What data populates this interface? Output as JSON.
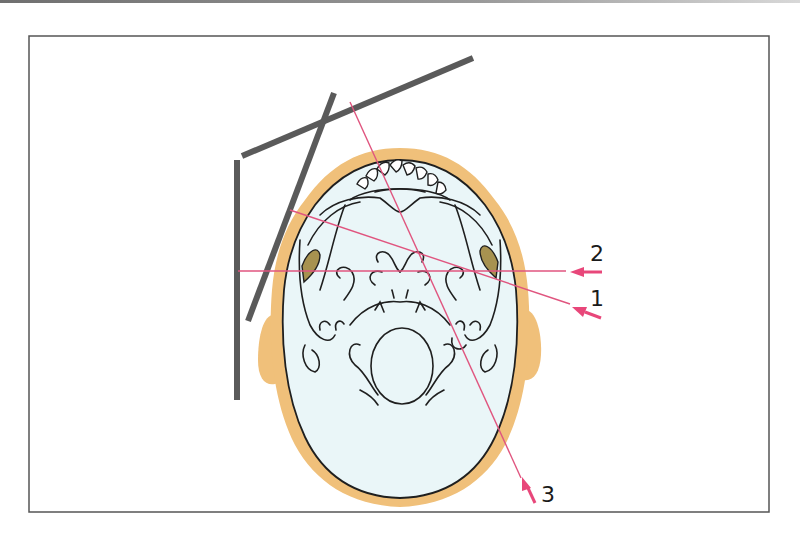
{
  "figure": {
    "labels": {
      "beam_1": "1",
      "beam_2": "2",
      "beam_3": "3"
    }
  },
  "colors": {
    "frame_border": "#555555",
    "plate": "#5a5a5a",
    "beam": "#e0557f",
    "beam_arrow": "#e8477a",
    "skin": "#f0c07a",
    "bone_fill": "#eaf6f8",
    "bone_outline": "#1f1f1f",
    "petrous": "#a79250"
  }
}
